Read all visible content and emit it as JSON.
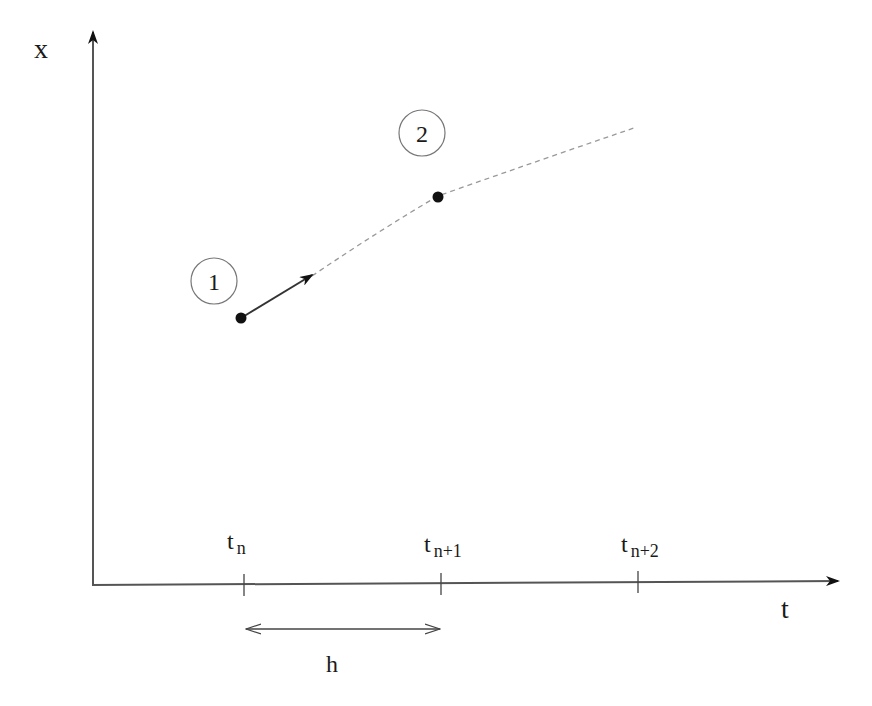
{
  "diagram": {
    "axes": {
      "y_label": "x",
      "x_label": "t"
    },
    "ticks": [
      {
        "main": "t",
        "sub": "n"
      },
      {
        "main": "t",
        "sub": "n+1"
      },
      {
        "main": "t",
        "sub": "n+2"
      }
    ],
    "step_label": "h",
    "markers": [
      {
        "label": "1"
      },
      {
        "label": "2"
      }
    ],
    "colors": {
      "axis": "#555555",
      "solid": "#333333",
      "dashed": "#999999",
      "point": "#111111"
    }
  }
}
